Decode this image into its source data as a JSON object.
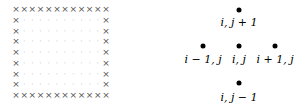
{
  "grid": {
    "columns": 12,
    "rows": 9,
    "boundary_symbol": "×",
    "interior_symbol": "·",
    "x_start": 16,
    "x_end": 106,
    "y_start": 9,
    "y_end": 95
  },
  "stencil": {
    "points": [
      {
        "id": "north",
        "x": 239,
        "y": 10,
        "label": "i, j + 1",
        "label_y": 22
      },
      {
        "id": "west",
        "x": 203,
        "y": 46,
        "label": "i − 1, j",
        "label_y": 59
      },
      {
        "id": "center",
        "x": 239,
        "y": 46,
        "label": "i, j",
        "label_y": 59
      },
      {
        "id": "east",
        "x": 275,
        "y": 46,
        "label": "i + 1, j",
        "label_y": 59
      },
      {
        "id": "south",
        "x": 239,
        "y": 83,
        "label": "i, j − 1",
        "label_y": 97
      }
    ]
  }
}
